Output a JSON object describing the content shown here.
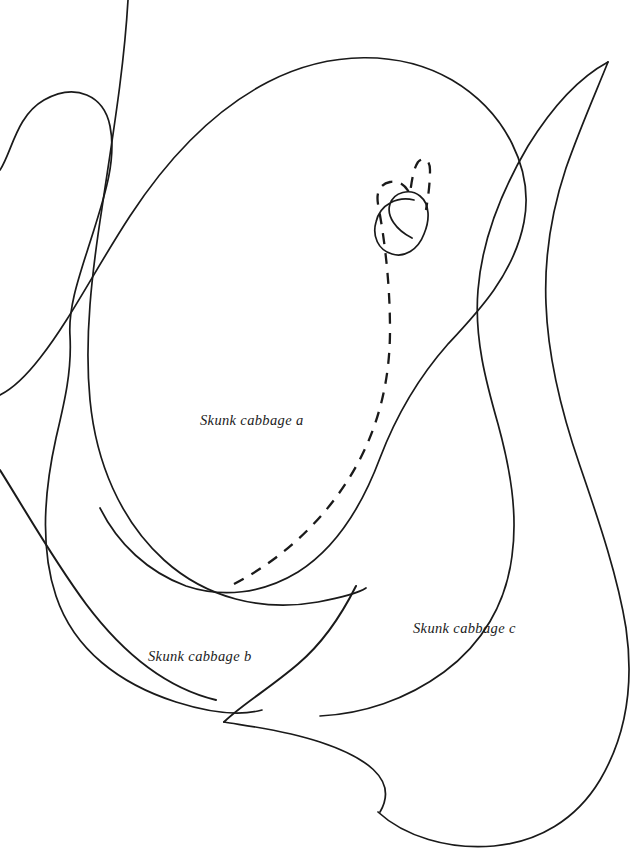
{
  "figure": {
    "kind": "botanical-line-drawing",
    "background_color": "#ffffff",
    "stroke_color": "#1a1a1a",
    "width": 638,
    "height": 855,
    "labels": [
      {
        "id": "a",
        "text": "Skunk cabbage a",
        "x": 200,
        "y": 412
      },
      {
        "id": "b",
        "text": "Skunk cabbage b",
        "x": 148,
        "y": 648
      },
      {
        "id": "c",
        "text": "Skunk cabbage c",
        "x": 413,
        "y": 620
      }
    ],
    "paths": [
      {
        "id": "inner-spathe-a",
        "style": "solid",
        "stroke_width": 1.7,
        "d": "M 0 170 C 12 152 16 116 44 100 C 76 82 104 96 110 126 C 117 160 104 198 92 236 C 80 274 68 306 70 336 C 72 372 64 404 56 438 C 44 492 40 548 56 596 C 74 650 120 684 176 702 C 214 714 240 716 262 710"
      },
      {
        "id": "outer-leaf-a",
        "style": "solid",
        "stroke_width": 1.7,
        "d": "M 0 395 C 14 388 26 376 40 358 C 70 320 96 268 130 216 C 168 158 214 110 268 82 C 330 50 400 50 452 80 C 506 112 534 170 524 222 C 514 274 478 312 448 344 C 418 378 396 416 380 458 C 362 506 336 548 298 572 C 262 594 222 598 186 586 C 148 572 118 544 100 508"
      },
      {
        "id": "mid-curve-a",
        "style": "solid",
        "stroke_width": 1.7,
        "d": "M 128 0 C 124 70 112 140 102 208 C 92 272 84 338 90 400 C 96 462 120 520 164 560 C 206 598 262 612 318 602 C 344 597 360 592 366 588"
      },
      {
        "id": "spathe-hook",
        "style": "solid",
        "stroke_width": 1.7,
        "d": "M 412 238 C 396 230 386 216 390 204 C 394 192 410 188 420 196 C 430 204 430 220 424 234 C 418 250 404 258 392 254 C 378 250 372 236 376 222 C 380 204 398 196 414 200"
      },
      {
        "id": "leaf-c-outer",
        "style": "solid",
        "stroke_width": 1.7,
        "d": "M 608 62 C 596 92 580 128 566 168 C 552 210 544 256 546 304 C 548 360 562 414 580 466 C 600 524 618 578 626 628 C 634 684 626 736 600 780 C 576 820 538 842 494 846 C 448 850 404 836 378 812"
      },
      {
        "id": "leaf-c-inner",
        "style": "solid",
        "stroke_width": 1.7,
        "d": "M 608 62 C 582 76 554 104 528 146 C 502 190 482 240 478 290 C 474 338 486 382 498 424 C 510 468 518 512 512 556 C 506 604 482 644 444 672 C 406 700 362 714 320 716"
      },
      {
        "id": "cusp-upper",
        "style": "solid",
        "stroke_width": 1.7,
        "d": "M 356 586 C 342 614 324 642 298 664 C 270 688 240 706 224 722"
      },
      {
        "id": "cusp-lower",
        "style": "solid",
        "stroke_width": 1.7,
        "d": "M 224 722 C 248 726 284 730 320 742 C 362 756 400 778 380 812"
      },
      {
        "id": "lower-sweep",
        "style": "solid",
        "stroke_width": 1.7,
        "d": "M 0 470 C 24 508 52 558 86 604 C 122 652 166 688 216 700"
      },
      {
        "id": "dashed-spadix",
        "style": "dashed",
        "stroke_width": 2.3,
        "dasharray": "11 9",
        "d": "M 234 584 C 280 560 320 524 348 480 C 376 436 390 386 390 330 C 390 280 384 236 378 204 C 376 192 380 184 390 182 C 400 180 406 186 410 194 C 412 178 414 168 418 162 C 424 156 430 160 430 170 C 430 184 428 198 426 210"
      }
    ]
  }
}
